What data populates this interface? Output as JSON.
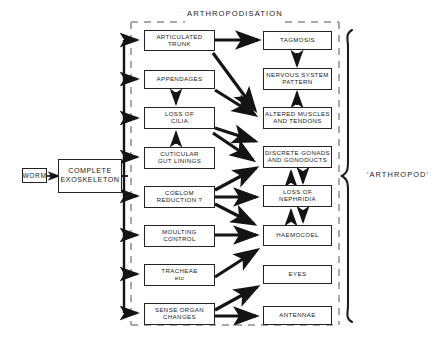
{
  "diagram": {
    "title": "ARTHROPODISATION",
    "outcome_label": "'ARTHROPOD'",
    "plus": "+",
    "inputs": {
      "worm": "WORM",
      "exoskeleton": "COMPLETE\nEXOSKELETON"
    },
    "process_column": [
      {
        "id": "articulated-trunk",
        "label": "ARTICULATED\nTRUNK"
      },
      {
        "id": "appendages",
        "label": "APPENDAGES"
      },
      {
        "id": "loss-of-cilia",
        "label": "LOSS  OF\nCILIA"
      },
      {
        "id": "cuticular-gut-linings",
        "label": "CUTICULAR\nGUT  LININGS"
      },
      {
        "id": "coelom-reduction",
        "label": "COELOM\nREDUCTION ?"
      },
      {
        "id": "moulting-control",
        "label": "MOULTING\nCONTROL"
      },
      {
        "id": "tracheae",
        "label": "TRACHEAE\netc"
      },
      {
        "id": "sense-organ-changes",
        "label": "SENSE ORGAN\nCHANGES"
      }
    ],
    "result_column": [
      {
        "id": "tagmosis",
        "label": "TAGMOSIS"
      },
      {
        "id": "nervous-system-pattern",
        "label": "NERVOUS SYSTEM\nPATTERN"
      },
      {
        "id": "altered-muscles-and-tendons",
        "label": "ALTERED MUSCLES\nAND TENDONS"
      },
      {
        "id": "discrete-gonads-and-gonoducts",
        "label": "DISCRETE GONADS\nAND GONODUCTS"
      },
      {
        "id": "loss-of-nephridia",
        "label": "LOSS  OF\nNEPHRIDIA"
      },
      {
        "id": "haemocoel",
        "label": "HAEMOCOEL"
      },
      {
        "id": "eyes",
        "label": "EYES"
      },
      {
        "id": "antennae",
        "label": "ANTENNAE"
      }
    ],
    "colors": {
      "ink": "#1a1a1a",
      "box_border": "#232323",
      "dashed_border": "#8d8d8d",
      "background": "#ffffff"
    }
  }
}
